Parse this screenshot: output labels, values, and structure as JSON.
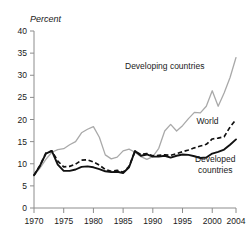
{
  "chart_data": {
    "type": "line",
    "title": "",
    "subtitle": "",
    "xlabel": "",
    "ylabel": "Percent",
    "ylabel_style": "italic",
    "xlim": [
      1970,
      2004
    ],
    "ylim": [
      0,
      40
    ],
    "grid": false,
    "legend": "inline-annotations",
    "y_ticks": [
      0,
      5,
      10,
      15,
      20,
      25,
      30,
      35,
      40
    ],
    "y_tick_labels": [
      "0",
      "5",
      "10",
      "15",
      "20",
      "25",
      "30",
      "35",
      "40"
    ],
    "x_ticks": [
      1970,
      1975,
      1980,
      1985,
      1990,
      1995,
      2000,
      2004
    ],
    "x_tick_labels": [
      "1970",
      "1975",
      "1980",
      "1985",
      "1990",
      "1995",
      "2000",
      "2004"
    ],
    "x": [
      1970,
      1971,
      1972,
      1973,
      1974,
      1975,
      1976,
      1977,
      1978,
      1979,
      1980,
      1981,
      1982,
      1983,
      1984,
      1985,
      1986,
      1987,
      1988,
      1989,
      1990,
      1991,
      1992,
      1993,
      1994,
      1995,
      1996,
      1997,
      1998,
      1999,
      2000,
      2001,
      2002,
      2003,
      2004
    ],
    "series": [
      {
        "name": "Developing countries",
        "style": "solid",
        "color": "#a9a9a9",
        "label_x": 1992,
        "label_y": 31.5,
        "values": [
          7.3,
          9.0,
          11.0,
          12.6,
          13.2,
          13.4,
          14.3,
          15.0,
          17.0,
          17.8,
          18.4,
          16.0,
          12.0,
          11.1,
          11.5,
          12.9,
          13.3,
          12.6,
          11.6,
          11.0,
          11.6,
          13.5,
          17.4,
          18.9,
          17.4,
          18.6,
          20.2,
          21.6,
          21.5,
          23.0,
          26.5,
          23.0,
          26.0,
          29.5,
          34.0
        ]
      },
      {
        "name": "World",
        "style": "dashed",
        "color": "#111111",
        "label_x": 1999.2,
        "label_y": 19.0,
        "values": [
          7.4,
          9.6,
          12.4,
          12.9,
          10.6,
          9.3,
          9.4,
          9.9,
          10.8,
          10.9,
          10.4,
          9.7,
          8.7,
          8.3,
          8.5,
          8.1,
          9.4,
          12.8,
          12.1,
          12.3,
          11.8,
          11.9,
          12.0,
          11.9,
          12.3,
          12.7,
          13.1,
          13.6,
          14.0,
          14.4,
          15.6,
          15.8,
          16.1,
          18.3,
          20.0
        ]
      },
      {
        "name": "Developed countries",
        "style": "solid",
        "color": "#111111",
        "label_x": 2000.5,
        "label_y": 10.3,
        "label_line2": "countries",
        "values": [
          7.4,
          9.5,
          12.3,
          12.9,
          9.8,
          8.4,
          8.4,
          8.7,
          9.3,
          9.4,
          9.2,
          8.8,
          8.3,
          8.1,
          8.2,
          7.9,
          9.2,
          12.9,
          11.8,
          12.1,
          11.6,
          11.6,
          11.8,
          11.4,
          11.8,
          12.1,
          12.0,
          11.7,
          11.3,
          11.4,
          12.3,
          12.7,
          13.2,
          14.3,
          15.5
        ]
      }
    ],
    "annotations": [
      {
        "text": "Developing countries",
        "x": 1992,
        "y": 31.5
      },
      {
        "text": "World",
        "x": 1999.2,
        "y": 19.0
      },
      {
        "text": "Developed",
        "x": 2000.5,
        "y": 10.3
      },
      {
        "text": "countries",
        "x": 2000.5,
        "y": 8.0
      }
    ]
  }
}
